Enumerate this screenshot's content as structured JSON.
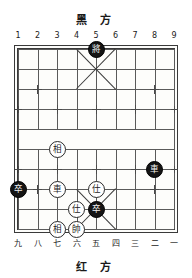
{
  "board": {
    "title_top": "黑 方",
    "title_bottom": "红 方",
    "top_coords": [
      "1",
      "2",
      "3",
      "4",
      "5",
      "6",
      "7",
      "8",
      "9"
    ],
    "bottom_coords": [
      "九",
      "八",
      "七",
      "六",
      "五",
      "四",
      "三",
      "二",
      "一"
    ],
    "files": 9,
    "ranks": 10,
    "colors": {
      "line": "#5a5a5a",
      "border": "#3a3a3a",
      "red_piece_bg": "#ffffff",
      "red_piece_text": "#1c1c1c",
      "black_piece_bg": "#141414",
      "black_piece_text": "#f2f2f2",
      "background": "#ffffff"
    }
  },
  "pieces": [
    {
      "id": "p1",
      "glyph": "將",
      "side": "black",
      "name": "black-general",
      "file": 4,
      "rank": 0
    },
    {
      "id": "p2",
      "glyph": "相",
      "side": "red",
      "name": "red-elephant-left",
      "file": 2,
      "rank": 5
    },
    {
      "id": "p3",
      "glyph": "車",
      "side": "black",
      "name": "black-chariot",
      "file": 7,
      "rank": 6
    },
    {
      "id": "p4",
      "glyph": "車",
      "side": "red",
      "name": "red-chariot",
      "file": 2,
      "rank": 7
    },
    {
      "id": "p5",
      "glyph": "卒",
      "side": "black",
      "name": "black-pawn-left",
      "file": 0,
      "rank": 7
    },
    {
      "id": "p6",
      "glyph": "仕",
      "side": "red",
      "name": "red-advisor-right",
      "file": 4,
      "rank": 7
    },
    {
      "id": "p7",
      "glyph": "仕",
      "side": "red",
      "name": "red-advisor-left",
      "file": 3,
      "rank": 8
    },
    {
      "id": "p8",
      "glyph": "卒",
      "side": "black",
      "name": "black-pawn-center",
      "file": 4,
      "rank": 8
    },
    {
      "id": "p9",
      "glyph": "相",
      "side": "red",
      "name": "red-elephant-bottom",
      "file": 2,
      "rank": 9
    },
    {
      "id": "p10",
      "glyph": "帥",
      "side": "red",
      "name": "red-general",
      "file": 3,
      "rank": 9
    }
  ],
  "star_points": [
    {
      "file": 1,
      "rank": 2
    },
    {
      "file": 7,
      "rank": 2
    },
    {
      "file": 0,
      "rank": 3
    },
    {
      "file": 2,
      "rank": 3
    },
    {
      "file": 4,
      "rank": 3
    },
    {
      "file": 6,
      "rank": 3
    },
    {
      "file": 8,
      "rank": 3
    },
    {
      "file": 0,
      "rank": 6
    },
    {
      "file": 2,
      "rank": 6
    },
    {
      "file": 4,
      "rank": 6
    },
    {
      "file": 6,
      "rank": 6
    },
    {
      "file": 8,
      "rank": 6
    },
    {
      "file": 1,
      "rank": 7
    },
    {
      "file": 7,
      "rank": 7
    }
  ]
}
